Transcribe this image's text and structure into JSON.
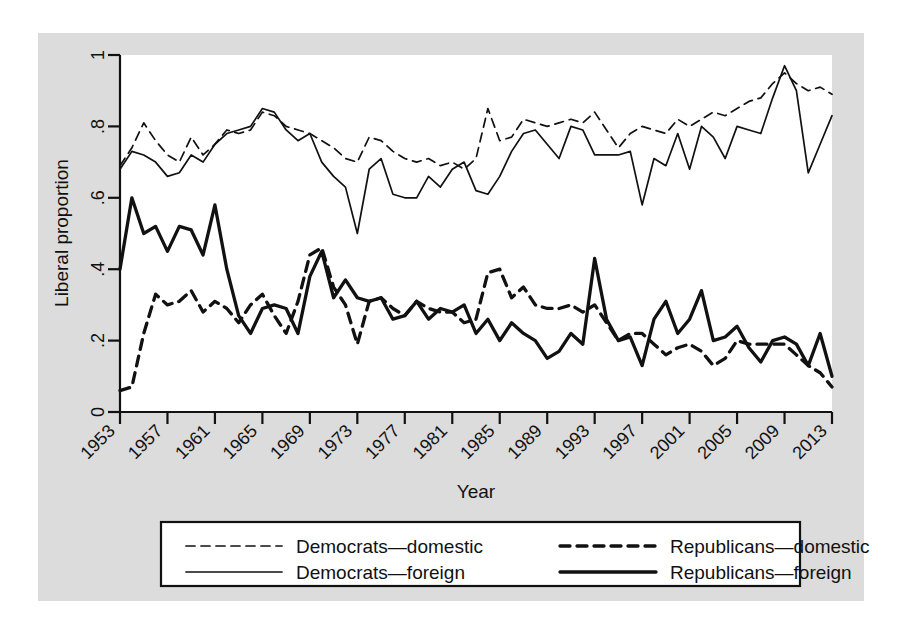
{
  "figure": {
    "background_color": "#dcdcdc",
    "plot_background_color": "#ffffff",
    "line_color": "#111111"
  },
  "chart_data": {
    "type": "line",
    "title": "",
    "xlabel": "Year",
    "ylabel": "Liberal proportion",
    "xlim": [
      1953,
      2013
    ],
    "ylim": [
      0,
      1
    ],
    "grid": false,
    "legend_position": "below-plot",
    "xticks": [
      1953,
      1957,
      1961,
      1965,
      1969,
      1973,
      1977,
      1981,
      1985,
      1989,
      1993,
      1997,
      2001,
      2005,
      2009,
      2013
    ],
    "xtick_labels": [
      "1953",
      "1957",
      "1961",
      "1965",
      "1969",
      "1973",
      "1977",
      "1981",
      "1985",
      "1989",
      "1993",
      "1997",
      "2001",
      "2005",
      "2009",
      "2013"
    ],
    "yticks": [
      0,
      0.2,
      0.4,
      0.6,
      0.8,
      1
    ],
    "ytick_labels": [
      "0",
      ".2",
      ".4",
      ".6",
      ".8",
      "1"
    ],
    "x": [
      1953,
      1954,
      1955,
      1956,
      1957,
      1958,
      1959,
      1960,
      1961,
      1962,
      1963,
      1964,
      1965,
      1966,
      1967,
      1968,
      1969,
      1970,
      1971,
      1972,
      1973,
      1974,
      1975,
      1976,
      1977,
      1978,
      1979,
      1980,
      1981,
      1982,
      1983,
      1984,
      1985,
      1986,
      1987,
      1988,
      1989,
      1990,
      1991,
      1992,
      1993,
      1994,
      1995,
      1996,
      1997,
      1998,
      1999,
      2000,
      2001,
      2002,
      2003,
      2004,
      2005,
      2006,
      2007,
      2008,
      2009,
      2010,
      2011,
      2012,
      2013
    ],
    "series": [
      {
        "name": "Democrats—domestic",
        "style": "dashed",
        "weight": "thin",
        "values": [
          0.69,
          0.74,
          0.81,
          0.76,
          0.72,
          0.7,
          0.77,
          0.72,
          0.75,
          0.79,
          0.78,
          0.79,
          0.84,
          0.83,
          0.8,
          0.79,
          0.78,
          0.76,
          0.74,
          0.71,
          0.7,
          0.77,
          0.76,
          0.73,
          0.71,
          0.7,
          0.71,
          0.69,
          0.7,
          0.68,
          0.71,
          0.85,
          0.76,
          0.77,
          0.82,
          0.81,
          0.8,
          0.81,
          0.82,
          0.81,
          0.84,
          0.79,
          0.74,
          0.78,
          0.8,
          0.79,
          0.78,
          0.82,
          0.8,
          0.82,
          0.84,
          0.83,
          0.85,
          0.87,
          0.88,
          0.92,
          0.95,
          0.92,
          0.9,
          0.91,
          0.89
        ]
      },
      {
        "name": "Democrats—foreign",
        "style": "solid",
        "weight": "thin",
        "values": [
          0.68,
          0.73,
          0.72,
          0.7,
          0.66,
          0.67,
          0.72,
          0.7,
          0.75,
          0.78,
          0.79,
          0.8,
          0.85,
          0.84,
          0.79,
          0.76,
          0.78,
          0.7,
          0.66,
          0.63,
          0.5,
          0.68,
          0.71,
          0.61,
          0.6,
          0.6,
          0.66,
          0.63,
          0.68,
          0.7,
          0.62,
          0.61,
          0.66,
          0.73,
          0.78,
          0.79,
          0.75,
          0.71,
          0.8,
          0.79,
          0.72,
          0.72,
          0.72,
          0.73,
          0.58,
          0.71,
          0.69,
          0.78,
          0.68,
          0.8,
          0.77,
          0.71,
          0.8,
          0.79,
          0.78,
          0.88,
          0.97,
          0.9,
          0.67,
          0.75,
          0.83
        ]
      },
      {
        "name": "Republicans—domestic",
        "style": "dashed",
        "weight": "thick",
        "values": [
          0.06,
          0.07,
          0.22,
          0.33,
          0.3,
          0.31,
          0.34,
          0.28,
          0.31,
          0.29,
          0.25,
          0.3,
          0.33,
          0.27,
          0.22,
          0.31,
          0.44,
          0.46,
          0.35,
          0.3,
          0.19,
          0.31,
          0.32,
          0.29,
          0.27,
          0.31,
          0.29,
          0.28,
          0.28,
          0.25,
          0.26,
          0.39,
          0.4,
          0.32,
          0.35,
          0.3,
          0.29,
          0.29,
          0.3,
          0.28,
          0.3,
          0.25,
          0.2,
          0.22,
          0.22,
          0.19,
          0.16,
          0.18,
          0.19,
          0.17,
          0.13,
          0.15,
          0.2,
          0.19,
          0.19,
          0.19,
          0.19,
          0.16,
          0.13,
          0.11,
          0.07
        ]
      },
      {
        "name": "Republicans—foreign",
        "style": "solid",
        "weight": "thick",
        "values": [
          0.4,
          0.6,
          0.5,
          0.52,
          0.45,
          0.52,
          0.51,
          0.44,
          0.58,
          0.4,
          0.27,
          0.22,
          0.29,
          0.3,
          0.29,
          0.22,
          0.38,
          0.45,
          0.32,
          0.37,
          0.32,
          0.31,
          0.32,
          0.26,
          0.27,
          0.31,
          0.26,
          0.29,
          0.28,
          0.3,
          0.22,
          0.26,
          0.2,
          0.25,
          0.22,
          0.2,
          0.15,
          0.17,
          0.22,
          0.19,
          0.43,
          0.26,
          0.2,
          0.21,
          0.13,
          0.26,
          0.31,
          0.22,
          0.26,
          0.34,
          0.2,
          0.21,
          0.24,
          0.18,
          0.14,
          0.2,
          0.21,
          0.19,
          0.13,
          0.22,
          0.1
        ]
      }
    ]
  },
  "legend": {
    "entries": [
      {
        "label": "Democrats—domestic",
        "style": "dashed",
        "weight": "thin"
      },
      {
        "label": "Republicans—domestic",
        "style": "dashed",
        "weight": "thick"
      },
      {
        "label": "Democrats—foreign",
        "style": "solid",
        "weight": "thin"
      },
      {
        "label": "Republicans—foreign",
        "style": "solid",
        "weight": "thick"
      }
    ]
  }
}
